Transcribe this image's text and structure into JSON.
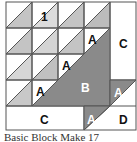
{
  "diagram": {
    "type": "quilt-block",
    "colors": {
      "light": "#d6d6d6",
      "medium": "#bdbdbd",
      "dark": "#8a8a8a",
      "background": "#ffffff",
      "line": "#555555"
    },
    "labels": {
      "unit": "1",
      "a1": "A",
      "a2": "A",
      "a3": "A",
      "a4": "A",
      "a5": "A",
      "b": "B",
      "c_right": "C",
      "c_bottom": "C",
      "d": "D"
    },
    "caption": "Basic Block Make 17"
  }
}
